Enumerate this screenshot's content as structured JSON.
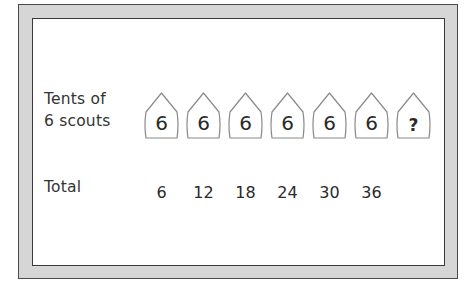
{
  "worksheet": {
    "rows": {
      "tents": {
        "label_line1": "Tents of",
        "label_line2": "6 scouts",
        "values": [
          "6",
          "6",
          "6",
          "6",
          "6",
          "6",
          "?"
        ]
      },
      "total": {
        "label": "Total",
        "values": [
          "6",
          "12",
          "18",
          "24",
          "30",
          "36",
          ""
        ]
      }
    }
  },
  "colors": {
    "frame_fill": "#d6d6d6",
    "frame_border": "#4a4a4a",
    "tent_outline": "#8a8a8a",
    "text": "#2a2a2a"
  }
}
